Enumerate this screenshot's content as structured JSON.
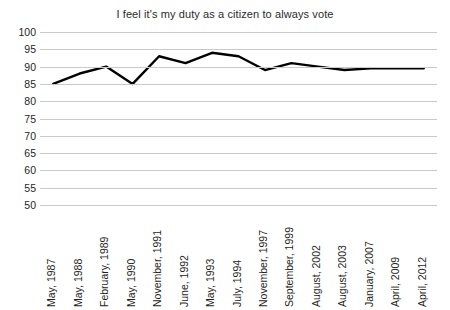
{
  "chart_data": {
    "type": "line",
    "title": "I feel it's my duty as a citizen to always vote",
    "xlabel": "",
    "ylabel": "",
    "ylim": [
      50,
      100
    ],
    "ytick_step": 5,
    "yticks": [
      100,
      95,
      90,
      85,
      80,
      75,
      70,
      65,
      60,
      55,
      50
    ],
    "grid": true,
    "legend": "none",
    "line_color": "#000000",
    "grid_color": "#c9c9c9",
    "categories": [
      "May, 1987",
      "May, 1988",
      "February, 1989",
      "May, 1990",
      "November, 1991",
      "June, 1992",
      "May, 1993",
      "July, 1994",
      "November, 1997",
      "September, 1999",
      "August, 2002",
      "August, 2003",
      "January, 2007",
      "April, 2009",
      "April, 2012"
    ],
    "values": [
      85,
      88,
      90,
      85,
      93,
      91,
      94,
      93,
      89,
      91,
      90,
      89,
      89.5,
      89.5,
      89.5
    ]
  }
}
